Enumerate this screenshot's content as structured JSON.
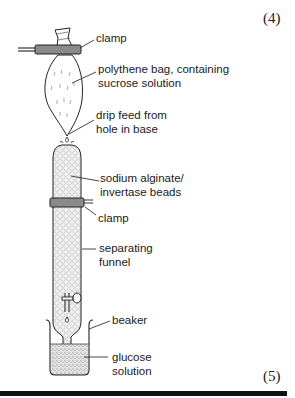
{
  "marks": {
    "top": "(4)",
    "bottom": "(5)"
  },
  "labels": {
    "clamp_top": "clamp",
    "bag_line1": "polythene bag, containing",
    "bag_line2": "sucrose solution",
    "drip_line1": "drip feed from",
    "drip_line2": "hole in base",
    "beads_line1": "sodium alginate/",
    "beads_line2": "invertase beads",
    "clamp_middle": "clamp",
    "funnel_line1": "separating",
    "funnel_line2": "funnel",
    "beaker": "beaker",
    "glucose_line1": "glucose",
    "glucose_line2": "solution"
  },
  "colors": {
    "ink": "#1a1a1a",
    "clamp_fill": "#8a8a8a",
    "bead_fill": "#efefef",
    "liquid_fill": "#d9d9d9"
  }
}
